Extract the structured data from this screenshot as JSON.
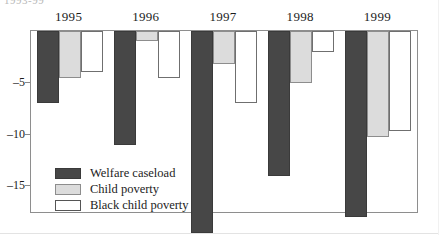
{
  "figure": {
    "cut_off_title": "1993-99",
    "axis_note": ""
  },
  "chart_data": {
    "type": "bar",
    "title": "",
    "subtitle": "",
    "xlabel": "",
    "ylabel": "",
    "orientation": "vertical-negative",
    "grid": false,
    "legend_position": "inside-bottom-left",
    "ylim": [
      -19.5,
      0
    ],
    "yticks": [
      -5,
      -10,
      -15
    ],
    "ytick_labels": [
      "–5",
      "–10",
      "–15"
    ],
    "categories": [
      "1995",
      "1996",
      "1997",
      "1998",
      "1999"
    ],
    "series": [
      {
        "name": "Welfare caseload",
        "color": "#474747",
        "style": "dark",
        "values": [
          -7.0,
          -11.0,
          -19.5,
          -14.0,
          -18.0
        ]
      },
      {
        "name": "Child poverty",
        "color": "#dcdcdc",
        "style": "gray",
        "values": [
          -4.5,
          -1.0,
          -3.2,
          -5.0,
          -10.2
        ]
      },
      {
        "name": "Black child poverty",
        "color": "#ffffff",
        "style": "white",
        "values": [
          -4.0,
          -4.5,
          -7.0,
          -2.0,
          -9.7
        ]
      }
    ]
  },
  "legend": {
    "entries": [
      {
        "label": "Welfare caseload",
        "style": "dark"
      },
      {
        "label": "Child poverty",
        "style": "gray"
      },
      {
        "label": "Black child poverty",
        "style": "white"
      }
    ]
  }
}
